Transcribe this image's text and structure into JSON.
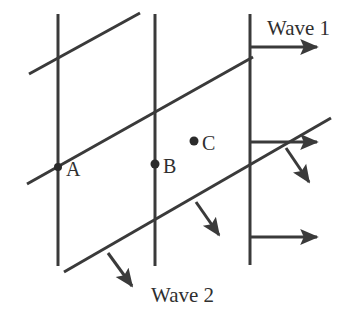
{
  "diagram": {
    "type": "physics-wavefront-diagram",
    "canvas": {
      "width": 349,
      "height": 328,
      "background": "#ffffff"
    },
    "style": {
      "line_color": "#3a3a3a",
      "line_width": 3,
      "dot_color": "#2b2b2b",
      "text_color": "#2f2f2f"
    },
    "labels": {
      "wave1": "Wave 1",
      "wave2": "Wave 2",
      "point_a": "A",
      "point_b": "B",
      "point_c": "C"
    },
    "points": [
      {
        "id": "A",
        "label": "A",
        "x": 58,
        "y": 167,
        "label_x": 66,
        "label_y": 176,
        "has_dot": true,
        "dot_r": 4
      },
      {
        "id": "B",
        "label": "B",
        "x": 155,
        "y": 164,
        "label_x": 163,
        "label_y": 173,
        "has_dot": true,
        "dot_r": 4.5
      },
      {
        "id": "C",
        "label": "C",
        "x": 194,
        "y": 141,
        "label_x": 202,
        "label_y": 150,
        "has_dot": true,
        "dot_r": 4.5
      }
    ],
    "wavefronts_vertical": [
      {
        "id": "wavefront-1-left",
        "x1": 58,
        "y1": 14,
        "x2": 58,
        "y2": 266
      },
      {
        "id": "wavefront-1-middle",
        "x1": 155,
        "y1": 14,
        "x2": 155,
        "y2": 266
      },
      {
        "id": "wavefront-1-right",
        "x1": 250,
        "y1": 14,
        "x2": 250,
        "y2": 265
      }
    ],
    "wavefronts_diagonal": [
      {
        "id": "wavefront-2-top",
        "x1": 29,
        "y1": 74,
        "x2": 140,
        "y2": 13
      },
      {
        "id": "wavefront-2-middle",
        "x1": 27,
        "y1": 184,
        "x2": 253,
        "y2": 57
      },
      {
        "id": "wavefront-2-bottom",
        "x1": 64,
        "y1": 272,
        "x2": 331,
        "y2": 118
      }
    ],
    "arrows": [
      {
        "id": "wave1-propagation-top",
        "direction": "right",
        "x1": 250,
        "y1": 47,
        "x2": 322,
        "y2": 47
      },
      {
        "id": "wave1-propagation-middle",
        "direction": "right",
        "x1": 250,
        "y1": 142,
        "x2": 322,
        "y2": 142
      },
      {
        "id": "wave1-propagation-bottom",
        "direction": "right",
        "x1": 250,
        "y1": 237,
        "x2": 322,
        "y2": 237
      },
      {
        "id": "wave2-propagation-left",
        "direction": "down-right",
        "x1": 108,
        "y1": 253,
        "x2": 136,
        "y2": 292
      },
      {
        "id": "wave2-propagation-middle",
        "direction": "down-right",
        "x1": 196,
        "y1": 202,
        "x2": 223,
        "y2": 241
      },
      {
        "id": "wave2-propagation-right",
        "direction": "down-right",
        "x1": 286,
        "y1": 148,
        "x2": 313,
        "y2": 188
      }
    ],
    "text_items": [
      {
        "id": "wave1-label",
        "text_key": "wave1",
        "x": 267,
        "y": 35,
        "anchor": "start",
        "size": 21
      },
      {
        "id": "wave2-label",
        "text_key": "wave2",
        "x": 151,
        "y": 302,
        "anchor": "start",
        "size": 21
      }
    ]
  }
}
